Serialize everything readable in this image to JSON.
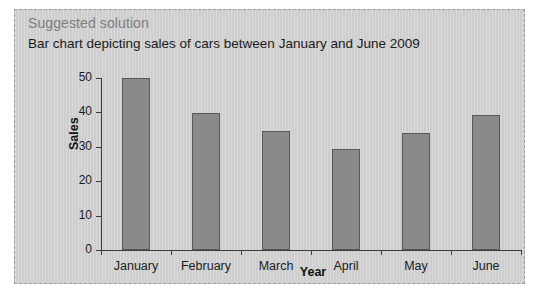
{
  "panel": {
    "heading": "Suggested solution",
    "subheading": "Bar chart depicting sales of cars between January and June 2009",
    "heading_color": "#7d7d7d",
    "background_color": "#d2d2d2",
    "border_color": "#9a9a9a"
  },
  "chart_data": {
    "type": "bar",
    "title": "Bar chart depicting sales of cars between January and June 2009",
    "subtitle": "",
    "categories": [
      "January",
      "February",
      "March",
      "April",
      "May",
      "June"
    ],
    "values": [
      50,
      39.7,
      34.5,
      29.5,
      34,
      39.3
    ],
    "xlabel": "Year",
    "ylabel": "Sales",
    "ylim": [
      0,
      50
    ],
    "yticks": [
      0,
      10,
      20,
      30,
      40,
      50
    ],
    "ytick_labels": [
      "0",
      "10",
      "20",
      "30",
      "40",
      "50"
    ],
    "grid": false,
    "legend": false,
    "legend_position": "none",
    "bar_color": "#8a8a8a",
    "bar_edge_color": "#595959"
  }
}
